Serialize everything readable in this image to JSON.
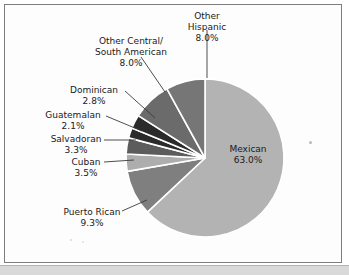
{
  "figure": {
    "background": "#fdfdfd",
    "frame_color": "#7d7d7d"
  },
  "chart_data": {
    "type": "pie",
    "title": "",
    "subtitle": "",
    "xlabel": "",
    "ylabel": "",
    "legend_position": "none",
    "label_format": "name + percent",
    "start_angle_deg": 0,
    "direction": "clockwise",
    "categories": [
      "Mexican",
      "Puerto Rican",
      "Cuban",
      "Salvadoran",
      "Guatemalan",
      "Dominican",
      "Other Central/South American",
      "Other Hispanic"
    ],
    "values": [
      63.0,
      9.3,
      3.5,
      3.3,
      2.1,
      2.8,
      8.0,
      8.0
    ],
    "value_labels": [
      "63.0%",
      "9.3%",
      "3.5%",
      "3.3%",
      "2.1%",
      "2.8%",
      "8.0%",
      "8.0%"
    ],
    "colors": [
      "#b3b3b3",
      "#7f7f7f",
      "#adadad",
      "#5c5c5c",
      "#2b2b2b",
      "#2b2b2b",
      "#6b6b6b",
      "#767676"
    ],
    "slice_separator_color": "#ffffff",
    "slices": [
      {
        "name": "Mexican",
        "label_lines": [
          "Mexican",
          "63.0%"
        ],
        "percent": 63.0,
        "color": "#b3b3b3",
        "label_inside": true,
        "label_x": 248,
        "label_y": 152
      },
      {
        "name": "Puerto Rican",
        "label_lines": [
          "Puerto Rican",
          "9.3%"
        ],
        "percent": 9.3,
        "color": "#7f7f7f",
        "label_inside": false,
        "label_x": 92,
        "label_y": 216,
        "label_anchor": "middle"
      },
      {
        "name": "Cuban",
        "label_lines": [
          "Cuban",
          "3.5%"
        ],
        "percent": 3.5,
        "color": "#adadad",
        "label_inside": false,
        "label_x": 86,
        "label_y": 164,
        "label_anchor": "middle"
      },
      {
        "name": "Salvadoran",
        "label_lines": [
          "Salvadoran",
          "3.3%"
        ],
        "percent": 3.3,
        "color": "#5c5c5c",
        "label_inside": false,
        "label_x": 76,
        "label_y": 141,
        "label_anchor": "middle"
      },
      {
        "name": "Guatemalan",
        "label_lines": [
          "Guatemalan",
          "2.1%"
        ],
        "percent": 2.1,
        "color": "#2b2b2b",
        "label_inside": false,
        "label_x": 72,
        "label_y": 116,
        "label_anchor": "middle"
      },
      {
        "name": "Dominican",
        "label_lines": [
          "Dominican",
          "2.8%"
        ],
        "percent": 2.8,
        "color": "#2b2b2b",
        "label_inside": false,
        "label_x": 93,
        "label_y": 92,
        "label_anchor": "middle"
      },
      {
        "name": "Other Central/South American",
        "label_lines": [
          "Other Central/",
          "South American",
          "8.0%"
        ],
        "percent": 8.0,
        "color": "#6b6b6b",
        "label_inside": false,
        "label_x": 131,
        "label_y": 44,
        "label_anchor": "middle"
      },
      {
        "name": "Other Hispanic",
        "label_lines": [
          "Other",
          "Hispanic",
          "8.0%"
        ],
        "percent": 8.0,
        "color": "#767676",
        "label_inside": false,
        "label_x": 207,
        "label_y": 18,
        "label_anchor": "middle"
      }
    ],
    "geometry": {
      "center_x": 205,
      "center_y": 158,
      "radius": 79
    }
  },
  "labels": {
    "mexican_name": "Mexican",
    "mexican_pct": "63.0%",
    "puerto_rican_name": "Puerto Rican",
    "puerto_rican_pct": "9.3%",
    "cuban_name": "Cuban",
    "cuban_pct": "3.5%",
    "salvadoran_name": "Salvadoran",
    "salvadoran_pct": "3.3%",
    "guatemalan_name": "Guatemalan",
    "guatemalan_pct": "2.1%",
    "dominican_name": "Dominican",
    "dominican_pct": "2.8%",
    "other_cs_line1": "Other Central/",
    "other_cs_line2": "South American",
    "other_cs_pct": "8.0%",
    "other_hispanic_line1": "Other",
    "other_hispanic_line2": "Hispanic",
    "other_hispanic_pct": "8.0%"
  }
}
